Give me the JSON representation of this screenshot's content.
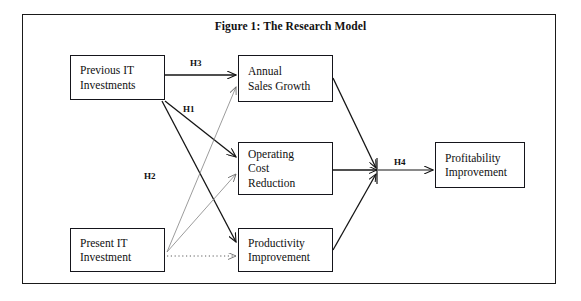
{
  "figure": {
    "title": "Figure 1: The Research Model",
    "border_color": "#15151b",
    "background": "#ffffff"
  },
  "nodes": [
    {
      "id": "previous-it",
      "lines": [
        "Previous IT",
        "Investments"
      ]
    },
    {
      "id": "annual-sales",
      "lines": [
        "Annual",
        "Sales Growth"
      ]
    },
    {
      "id": "operating",
      "lines": [
        "Operating",
        "Cost",
        "Reduction"
      ]
    },
    {
      "id": "productivity",
      "lines": [
        "Productivity",
        "Improvement"
      ]
    },
    {
      "id": "present-it",
      "lines": [
        "Present IT",
        "Investment"
      ]
    },
    {
      "id": "profitability",
      "lines": [
        "Profitability",
        "Improvement"
      ]
    }
  ],
  "hypotheses": [
    {
      "id": "h1",
      "label": "H1"
    },
    {
      "id": "h2",
      "label": "H2"
    },
    {
      "id": "h3",
      "label": "H3"
    },
    {
      "id": "h4",
      "label": "H4"
    }
  ]
}
